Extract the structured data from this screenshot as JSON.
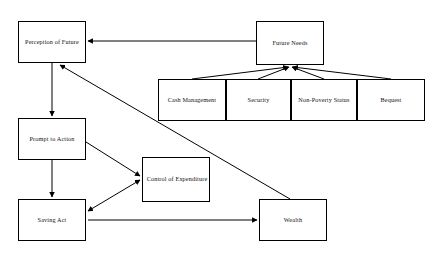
{
  "diagram": {
    "background_color": "#ffffff",
    "line_color": "#000000",
    "text_color": "#111111",
    "nodes": [
      {
        "id": "perception-of-future",
        "label": "Perception of Future",
        "x": 18,
        "y": 21,
        "w": 68,
        "h": 42
      },
      {
        "id": "future-needs",
        "label": "Future Needs",
        "x": 256,
        "y": 21,
        "w": 68,
        "h": 44
      },
      {
        "id": "cash-management",
        "label": "Cash Management",
        "x": 158,
        "y": 79,
        "w": 68,
        "h": 42
      },
      {
        "id": "security",
        "label": "Security",
        "x": 226,
        "y": 79,
        "w": 65,
        "h": 42
      },
      {
        "id": "non-poverty-status",
        "label": "Non-Poverty Status",
        "x": 291,
        "y": 79,
        "w": 66,
        "h": 42
      },
      {
        "id": "bequest",
        "label": "Bequest",
        "x": 357,
        "y": 79,
        "w": 68,
        "h": 42
      },
      {
        "id": "prompt-to-action",
        "label": "Prompt to Action",
        "x": 18,
        "y": 118,
        "w": 68,
        "h": 42
      },
      {
        "id": "control-of-expenditure",
        "label": "Control of Expenditure",
        "x": 142,
        "y": 157,
        "w": 68,
        "h": 45
      },
      {
        "id": "saving-act",
        "label": "Saving Act",
        "x": 18,
        "y": 199,
        "w": 68,
        "h": 42
      },
      {
        "id": "wealth",
        "label": "Wealth",
        "x": 259,
        "y": 199,
        "w": 68,
        "h": 42
      }
    ],
    "edges": [
      {
        "id": "future-needs-to-perception",
        "from": "future-needs",
        "to": "perception-of-future",
        "kind": "arrow",
        "points": "256,41 88,41"
      },
      {
        "id": "cash-management-to-future-needs",
        "from": "cash-management",
        "to": "future-needs",
        "kind": "arrow",
        "points": "192,79 288,67"
      },
      {
        "id": "security-to-future-needs",
        "from": "security",
        "to": "future-needs",
        "kind": "arrow",
        "points": "258,79 289,67"
      },
      {
        "id": "non-poverty-status-to-future-needs",
        "from": "non-poverty-status",
        "to": "future-needs",
        "kind": "arrow",
        "points": "324,79 292,67"
      },
      {
        "id": "bequest-to-future-needs",
        "from": "bequest",
        "to": "future-needs",
        "kind": "arrow",
        "points": "391,79 293,67"
      },
      {
        "id": "perception-to-prompt-to-action",
        "from": "perception-of-future",
        "to": "prompt-to-action",
        "kind": "arrow",
        "points": "52,63 52,116"
      },
      {
        "id": "prompt-to-action-to-saving-act",
        "from": "prompt-to-action",
        "to": "saving-act",
        "kind": "arrow",
        "points": "52,160 52,197"
      },
      {
        "id": "prompt-to-action-to-control",
        "from": "prompt-to-action",
        "to": "control-of-expenditure",
        "kind": "arrow",
        "points": "86,142 140,176"
      },
      {
        "id": "saving-act-control-bidirectional",
        "from": "saving-act",
        "to": "control-of-expenditure",
        "kind": "biarrow",
        "points": "88,211 140,180"
      },
      {
        "id": "saving-act-to-wealth",
        "from": "saving-act",
        "to": "wealth",
        "kind": "arrow",
        "points": "88,220 257,220"
      },
      {
        "id": "wealth-to-perception-of-future",
        "from": "wealth",
        "to": "perception-of-future",
        "kind": "arrow",
        "points": "290,199 60,65"
      }
    ]
  }
}
